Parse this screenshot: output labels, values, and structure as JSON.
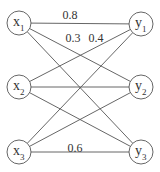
{
  "diagram": {
    "nodes": [
      {
        "id": "x1",
        "base": "x",
        "sub": "1",
        "cx": 19,
        "cy": 23
      },
      {
        "id": "x2",
        "base": "x",
        "sub": "2",
        "cx": 19,
        "cy": 87
      },
      {
        "id": "x3",
        "base": "x",
        "sub": "3",
        "cx": 19,
        "cy": 152
      },
      {
        "id": "y1",
        "base": "y",
        "sub": "1",
        "cx": 141,
        "cy": 24
      },
      {
        "id": "y2",
        "base": "y",
        "sub": "2",
        "cx": 141,
        "cy": 87
      },
      {
        "id": "y3",
        "base": "y",
        "sub": "3",
        "cx": 141,
        "cy": 152
      }
    ],
    "edges": [
      {
        "from": "x1",
        "to": "y1"
      },
      {
        "from": "x1",
        "to": "y2"
      },
      {
        "from": "x1",
        "to": "y3"
      },
      {
        "from": "x2",
        "to": "y1"
      },
      {
        "from": "x2",
        "to": "y2"
      },
      {
        "from": "x2",
        "to": "y3"
      },
      {
        "from": "x3",
        "to": "y1"
      },
      {
        "from": "x3",
        "to": "y2"
      },
      {
        "from": "x3",
        "to": "y3"
      }
    ],
    "weights": [
      {
        "text": "0.8",
        "x": 70,
        "y": 19
      },
      {
        "text": "0.3",
        "x": 73,
        "y": 42
      },
      {
        "text": "0.4",
        "x": 96,
        "y": 42
      },
      {
        "text": "0.6",
        "x": 75,
        "y": 152
      }
    ],
    "node_radius": 12
  }
}
